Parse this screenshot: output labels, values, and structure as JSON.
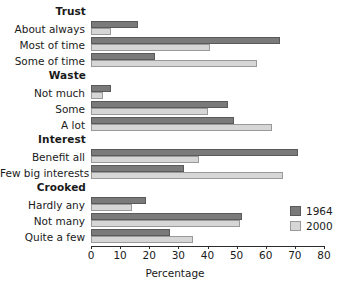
{
  "chart_data": {
    "type": "bar",
    "orientation": "horizontal",
    "title": "",
    "xlabel": "Percentage",
    "ylabel": "",
    "xlim": [
      0,
      80
    ],
    "xticks": [
      0,
      10,
      20,
      30,
      40,
      50,
      60,
      70,
      80
    ],
    "grid": false,
    "legend_position": "right",
    "colors": {
      "1964": "#7a7a7a",
      "2000": "#d6d6d6"
    },
    "series": [
      {
        "name": "1964",
        "values": [
          16,
          65,
          22,
          7,
          47,
          49,
          71,
          32,
          19,
          52,
          27
        ]
      },
      {
        "name": "2000",
        "values": [
          7,
          41,
          57,
          4,
          40,
          62,
          37,
          66,
          14,
          51,
          35
        ]
      }
    ],
    "categories": [
      "About always",
      "Most of time",
      "Some of time",
      "Not much",
      "Some",
      "A lot",
      "Benefit all",
      "Few big interests",
      "Hardly any",
      "Not many",
      "Quite a few"
    ],
    "groups": [
      {
        "header": "Trust",
        "rows": [
          {
            "label": "About always",
            "v1964": 16,
            "v2000": 7
          },
          {
            "label": "Most of time",
            "v1964": 65,
            "v2000": 41
          },
          {
            "label": "Some of time",
            "v1964": 22,
            "v2000": 57
          }
        ]
      },
      {
        "header": "Waste",
        "rows": [
          {
            "label": "Not much",
            "v1964": 7,
            "v2000": 4
          },
          {
            "label": "Some",
            "v1964": 47,
            "v2000": 40
          },
          {
            "label": "A lot",
            "v1964": 49,
            "v2000": 62
          }
        ]
      },
      {
        "header": "Interest",
        "rows": [
          {
            "label": "Benefit all",
            "v1964": 71,
            "v2000": 37
          },
          {
            "label": "Few big interests",
            "v1964": 32,
            "v2000": 66
          }
        ]
      },
      {
        "header": "Crooked",
        "rows": [
          {
            "label": "Hardly any",
            "v1964": 19,
            "v2000": 14
          },
          {
            "label": "Not many",
            "v1964": 52,
            "v2000": 51
          },
          {
            "label": "Quite a few",
            "v1964": 27,
            "v2000": 35
          }
        ]
      }
    ],
    "legend": [
      {
        "label": "1964",
        "key": "s1964"
      },
      {
        "label": "2000",
        "key": "s2000"
      }
    ]
  }
}
